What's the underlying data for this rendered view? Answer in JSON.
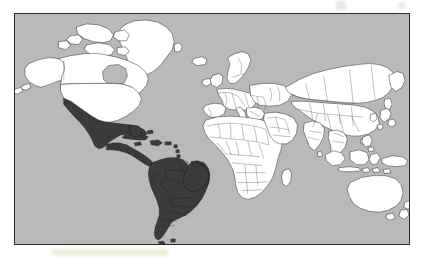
{
  "figure": {
    "type": "world-map",
    "title": "World map with Latin America highlighted",
    "projection": "Mercator",
    "caption": ""
  },
  "map": {
    "frame": {
      "border_color": "#2b2b2b",
      "border_width_px": 1,
      "x": 14,
      "y": 13,
      "width": 396,
      "height": 232
    },
    "colors": {
      "ocean": "#b9b9b9",
      "land": "#ffffff",
      "land_highlight": "#3b3b3b",
      "coastline": "#1f1f1f",
      "country_border": "#4a4a4a",
      "page_background": "#ffffff"
    },
    "legend": {
      "visible": false,
      "entries": [
        {
          "label": "Latin America",
          "color": "#3b3b3b"
        },
        {
          "label": "Rest of world",
          "color": "#ffffff"
        },
        {
          "label": "Ocean",
          "color": "#b9b9b9"
        }
      ]
    },
    "labels": {
      "visible": false,
      "graticule_visible": false,
      "scale_bar_visible": false,
      "north_arrow_visible": false
    },
    "highlighted_regions": [
      "Mexico",
      "Guatemala",
      "Belize",
      "Honduras",
      "El Salvador",
      "Nicaragua",
      "Costa Rica",
      "Panama",
      "Cuba",
      "Haiti",
      "Dominican Republic",
      "Jamaica",
      "Puerto Rico",
      "Colombia",
      "Venezuela",
      "Guyana",
      "Suriname",
      "French Guiana",
      "Ecuador",
      "Peru",
      "Brazil",
      "Bolivia",
      "Paraguay",
      "Chile",
      "Argentina",
      "Uruguay"
    ],
    "continents_shown": [
      "North America",
      "South America",
      "Europe",
      "Africa",
      "Asia",
      "Oceania",
      "Greenland"
    ]
  },
  "annotations": {
    "smudges": [
      {
        "name": "bottom-scan-smudge",
        "color": "#e2deba"
      },
      {
        "name": "top-right-scan-mark",
        "color": "#d2d0c8"
      }
    ]
  }
}
